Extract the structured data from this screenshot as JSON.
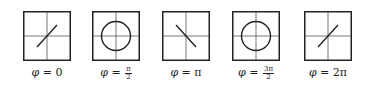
{
  "figure": {
    "stroke_color": "#222222",
    "grid_color": "#555555",
    "panels": [
      {
        "id": "phi-0",
        "shape": "line-positive-slope",
        "label_prefix": "φ = ",
        "label_value": "0",
        "label_num": "",
        "label_den": ""
      },
      {
        "id": "phi-pi-over-2",
        "shape": "circle",
        "label_prefix": "φ = ",
        "label_value": "",
        "label_num": "π",
        "label_den": "2"
      },
      {
        "id": "phi-pi",
        "shape": "line-negative-slope",
        "label_prefix": "φ = ",
        "label_value": "π",
        "label_num": "",
        "label_den": ""
      },
      {
        "id": "phi-3pi-over-2",
        "shape": "circle",
        "label_prefix": "φ = ",
        "label_value": "",
        "label_num": "3π",
        "label_den": "2"
      },
      {
        "id": "phi-2pi",
        "shape": "line-positive-slope",
        "label_prefix": "φ = ",
        "label_value": "2π",
        "label_num": "",
        "label_den": ""
      }
    ]
  }
}
